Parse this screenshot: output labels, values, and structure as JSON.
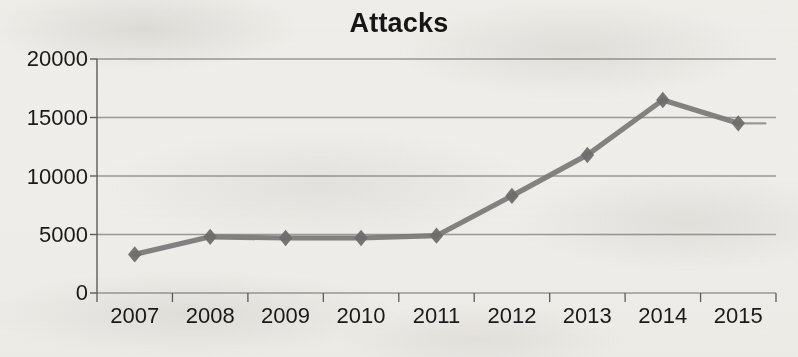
{
  "chart_data": {
    "type": "line",
    "title": "Attacks",
    "xlabel": "",
    "ylabel": "",
    "categories": [
      "2007",
      "2008",
      "2009",
      "2010",
      "2011",
      "2012",
      "2013",
      "2014",
      "2015"
    ],
    "values": [
      3300,
      4800,
      4700,
      4700,
      4900,
      8300,
      11800,
      16500,
      14500
    ],
    "series": [
      {
        "name": "Attacks",
        "values": [
          3300,
          4800,
          4700,
          4700,
          4900,
          8300,
          11800,
          16500,
          14500
        ]
      }
    ],
    "ylim": [
      0,
      20000
    ],
    "y_ticks": [
      "0",
      "5000",
      "10000",
      "15000",
      "20000"
    ],
    "y_tick_values": [
      0,
      5000,
      10000,
      15000,
      20000
    ],
    "grid": "horizontal",
    "legend": "none",
    "marker": "diamond",
    "line_color": "#7b7b7b",
    "marker_color": "#6f6f6f",
    "grid_color": "#8d8d8d",
    "axis_color": "#5d5d5d",
    "title_color": "#161616",
    "background_color": "#f2f1ee"
  }
}
